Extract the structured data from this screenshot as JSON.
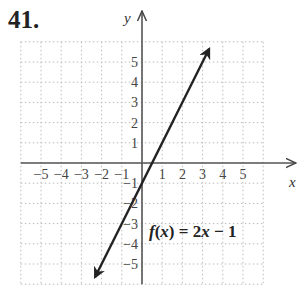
{
  "problem_number": "41.",
  "chart_data": {
    "type": "line",
    "title": "",
    "function_label": "f(x) = 2x − 1",
    "xlabel": "x",
    "ylabel": "y",
    "xlim": [
      -6,
      6
    ],
    "ylim": [
      -6,
      6
    ],
    "grid": true,
    "x_ticks": [
      -5,
      -4,
      -3,
      -2,
      -1,
      1,
      2,
      3,
      4,
      5
    ],
    "y_ticks": [
      5,
      4,
      3,
      2,
      1,
      -1,
      -2,
      -3,
      -4,
      -5
    ],
    "series": [
      {
        "name": "f(x) = 2x − 1",
        "x": [
          -2.5,
          3.5
        ],
        "y": [
          -6,
          6
        ],
        "slope": 2,
        "intercept": -1,
        "arrows": "both"
      }
    ]
  },
  "labels": {
    "x_axis": "x",
    "y_axis": "y",
    "function": "f(x) = 2x − 1"
  }
}
